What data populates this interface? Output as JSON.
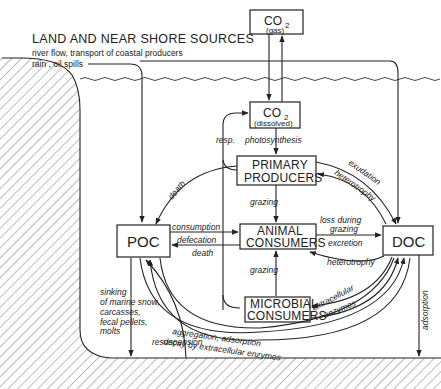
{
  "header": {
    "title": "LAND AND NEAR SHORE SOURCES",
    "sources_line1": "river flow, transport of coastal producers",
    "sources_line2": "rain , oil spills"
  },
  "boxes": {
    "co2_gas": {
      "main": "CO",
      "sub": "2",
      "qualifier": "(gas)"
    },
    "co2_dissolved": {
      "main": "CO",
      "sub": "2",
      "qualifier": "(dissolved)"
    },
    "primary_producers": {
      "line1": "PRIMARY",
      "line2": "PRODUCERS"
    },
    "animal_consumers": {
      "line1": "ANIMAL",
      "line2": "CONSUMERS"
    },
    "microbial_consumers": {
      "line1": "MICROBIAL",
      "line2": "CONSUMERS"
    },
    "poc": {
      "label": "POC"
    },
    "doc": {
      "label": "DOC"
    }
  },
  "flows": {
    "resp": "resp.",
    "photosynthesis": "photosynthesis",
    "death_pp": "death",
    "grazing_pp": "grazing",
    "exudation": "exudation",
    "heterotrophy_pp": "heterotrophy",
    "consumption": "consumption",
    "defecation": "defecation",
    "death_ac": "death",
    "loss_during": "loss during",
    "grazing_loss": "grazing",
    "excretion": "excretion",
    "heterotrophy_ac": "heterotrophy",
    "grazing_mc": "grazing",
    "extracellular": "extracellular",
    "enzymes": "enzymes",
    "aggregation": "aggregation, adsorption",
    "decay": "decay by extracellular enzymes",
    "sinking1": "sinking",
    "sinking2": "of marine snow,",
    "sinking3": "carcasses,",
    "sinking4": "fecal pellets,",
    "sinking5": "molts",
    "resuspension": "resuspension",
    "adsorption": "adsorption"
  },
  "colors": {
    "ink": "#222222",
    "background": "#ffffff"
  }
}
